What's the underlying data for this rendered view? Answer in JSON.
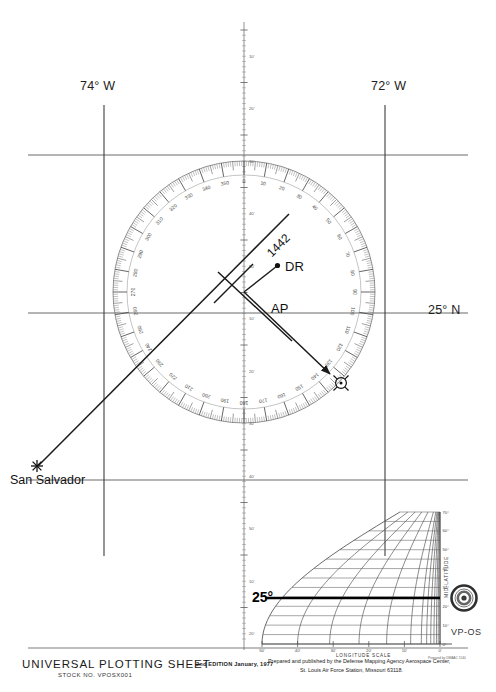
{
  "sheet": {
    "graticule": {
      "left_meridian_label": "74° W",
      "right_meridian_label": "72° W",
      "latitude_label": "25° N"
    },
    "plot": {
      "dr_label": "DR",
      "ap_label": "AP",
      "fix_time_label": "1442",
      "origin_label": "San Salvador",
      "body_symbol": "sun-symbol"
    },
    "compass_rose": {
      "major_labels": [
        0,
        10,
        20,
        30,
        40,
        50,
        60,
        70,
        80,
        90,
        100,
        110,
        120,
        130,
        140,
        150,
        160,
        170,
        180,
        190,
        200,
        210,
        220,
        230,
        240,
        250,
        260,
        270,
        280,
        290,
        300,
        310,
        320,
        330,
        340,
        350
      ],
      "tick_interval_deg": 1,
      "label_interval_deg": 10
    },
    "meridian_scale": {
      "ticks": [
        "10'",
        "20'",
        "30'",
        "40'",
        "50'"
      ]
    },
    "nomogram": {
      "latitude_annotation": "25°",
      "y_axis_label": "MID-LATITUDE",
      "x_axis_label": "LONGITUDE SCALE",
      "x_ticks": [
        "50'",
        "40'",
        "30'",
        "20'",
        "10'",
        "0'"
      ],
      "y_ticks": [
        "0°",
        "10°",
        "20°",
        "30°",
        "40°",
        "50°",
        "60°",
        "70°"
      ],
      "sheet_code": "VP-OS",
      "credit": "Prepared by DMAAC 1540",
      "seal": "dma-seal"
    }
  },
  "footer": {
    "title": "UNIVERSAL PLOTTING SHEET",
    "stock": "STOCK NO. VPOSX001",
    "edition": "2nd  EDITION  January, 1977",
    "publisher_line1": "Prepared and published by the Defense Mapping Agency Aerospace Center,",
    "publisher_line2": "St. Louis Air Force Station, Missouri 63118."
  },
  "colors": {
    "ink": "#2b2b2b",
    "grid": "#555555",
    "rose": "#6b6b6b",
    "annotation": "#111111"
  }
}
